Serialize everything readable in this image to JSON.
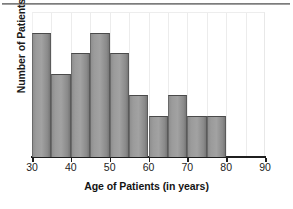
{
  "chart_data": {
    "type": "bar",
    "title": "",
    "subtitle": "",
    "xlabel": "Age of Patients (in years)",
    "ylabel": "Number of Patients",
    "xlim": [
      30,
      90
    ],
    "ylim": [
      0,
      7
    ],
    "bin_width": 5,
    "grid": true,
    "grid_axis": "x",
    "legend": null,
    "xticks": [
      {
        "value": 30,
        "label": "30"
      },
      {
        "value": 40,
        "label": "40"
      },
      {
        "value": 50,
        "label": "50"
      },
      {
        "value": 60,
        "label": "60"
      },
      {
        "value": 70,
        "label": "70"
      },
      {
        "value": 80,
        "label": "80"
      },
      {
        "value": 90,
        "label": "90"
      }
    ],
    "yticks": [],
    "categories": [
      "30-35",
      "35-40",
      "40-45",
      "45-50",
      "50-55",
      "55-60",
      "60-65",
      "65-70",
      "70-75",
      "75-80"
    ],
    "bins": [
      {
        "start": 30,
        "end": 35,
        "value": 6
      },
      {
        "start": 35,
        "end": 40,
        "value": 4
      },
      {
        "start": 40,
        "end": 45,
        "value": 5
      },
      {
        "start": 45,
        "end": 50,
        "value": 6
      },
      {
        "start": 50,
        "end": 55,
        "value": 5
      },
      {
        "start": 55,
        "end": 60,
        "value": 3
      },
      {
        "start": 60,
        "end": 65,
        "value": 2
      },
      {
        "start": 65,
        "end": 70,
        "value": 3
      },
      {
        "start": 70,
        "end": 75,
        "value": 2
      },
      {
        "start": 75,
        "end": 80,
        "value": 2
      }
    ],
    "values": [
      6,
      4,
      5,
      6,
      5,
      3,
      2,
      3,
      2,
      2
    ],
    "colors": {
      "bar_fill": "#9b9b9b",
      "bar_edge": "#4a4a4a",
      "axis": "#1f1f1f",
      "grid": "#ececec",
      "text": "#141414",
      "background": "#ffffff",
      "rule": "#6f6f6f"
    },
    "gridline_values": [
      35,
      40,
      45,
      50,
      55,
      60,
      65,
      70,
      75,
      80,
      85
    ]
  }
}
